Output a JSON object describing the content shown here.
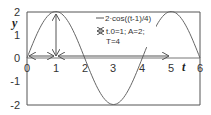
{
  "chart_data": {
    "type": "line",
    "title": "",
    "xlabel": "t",
    "ylabel": "y",
    "xlim": [
      0,
      6
    ],
    "ylim": [
      -2,
      2
    ],
    "x_ticks": [
      "0",
      "1",
      "2",
      "3",
      "4",
      "5",
      "6"
    ],
    "y_ticks": [
      "2",
      "1",
      "0",
      "-1",
      "-2"
    ],
    "grid": false,
    "legend_position": "upper-center-inside",
    "series": [
      {
        "name": "2·cos((t-1)/4)",
        "function": "2*cos(pi*(t-1)/2)",
        "x": [
          0,
          0.5,
          1,
          1.5,
          2,
          2.5,
          3,
          3.5,
          4,
          4.5,
          5,
          5.5,
          6
        ],
        "values": [
          0,
          1.41,
          2,
          1.41,
          0,
          -1.41,
          -2,
          -1.41,
          0,
          1.41,
          2,
          1.41,
          0
        ]
      }
    ],
    "annotations": [
      {
        "type": "double-arrow",
        "label": "t.0=1; A=2; T=4",
        "description": "horizontal arrow from t=0 to t=1, vertical arrow from y=0 to y=2 at t=1, horizontal arrow from t=1 to t=5"
      }
    ]
  },
  "legend": {
    "line_label": "2·cos((t-1)/4)",
    "arrow_label_1": "t.0=1; A=2;",
    "arrow_label_2": "T=4"
  },
  "axes": {
    "x_label": "t",
    "y_label": "y"
  }
}
